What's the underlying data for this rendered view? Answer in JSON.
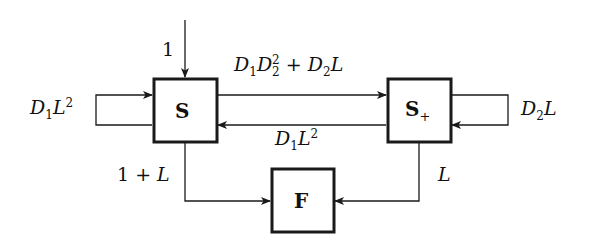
{
  "diagram": {
    "nodes": {
      "S": {
        "label": "S",
        "sub": ""
      },
      "S_plus": {
        "label": "S",
        "sub": "+"
      },
      "F": {
        "label": "F",
        "sub": ""
      }
    },
    "edges": {
      "input_to_S": {
        "label": "1"
      },
      "S_self_loop": {
        "D": "D",
        "Dsub": "1",
        "L": "L",
        "Lsup": "2"
      },
      "S_to_S_plus": {
        "p1": "D",
        "p1sub": "1",
        "p2": "D",
        "p2sub": "2",
        "p2sup": "2",
        "plus": " + ",
        "p3": "D",
        "p3sub": "2",
        "p4": "L"
      },
      "S_plus_to_S": {
        "D": "D",
        "Dsub": "1",
        "L": "L",
        "Lsup": "2"
      },
      "S_plus_self_loop": {
        "D": "D",
        "Dsub": "2",
        "L": "L"
      },
      "S_to_F": {
        "one": "1",
        "plus": " + ",
        "L": "L"
      },
      "S_plus_to_F": {
        "L": "L"
      }
    }
  },
  "colors": {
    "stroke": "#1a1a1a",
    "background": "#ffffff"
  }
}
